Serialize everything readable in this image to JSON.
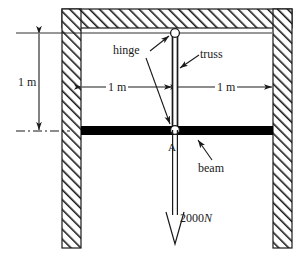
{
  "figure": {
    "labels": {
      "hinge": "hinge",
      "truss": "truss",
      "beam": "beam",
      "point_a": "A",
      "dimension_vertical": "1 m",
      "dimension_horizontal_left": "1 m",
      "dimension_horizontal_right": "1 m",
      "force_magnitude": "2000",
      "force_unit": "N"
    },
    "colors": {
      "line": "#1a1a1a",
      "hatch": "#1a1a1a",
      "beam_fill": "#000000",
      "hinge_fill": "#ffffff",
      "background": "#ffffff"
    },
    "geometry": {
      "vertical_height_m": 1,
      "left_span_m": 1,
      "right_span_m": 1,
      "load_N": 2000
    },
    "icons": {
      "hatch": "wall-hatch-icon",
      "hinge": "pin-hinge-icon",
      "load": "downward-force-arrow-icon",
      "centerline": "dash-dot-centerline-icon"
    }
  }
}
